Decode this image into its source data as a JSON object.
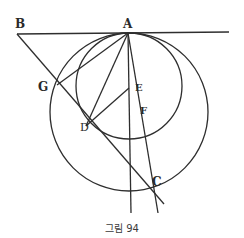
{
  "caption": "그림 94",
  "colors": {
    "ink": "#2e2e2e",
    "background": "#ffffff"
  },
  "points": {
    "A": {
      "label": "A",
      "x": 128,
      "y": 33
    },
    "B": {
      "label": "B",
      "x": 17,
      "y": 34
    },
    "G": {
      "label": "G",
      "x": 57,
      "y": 85
    },
    "D": {
      "label": "D",
      "x": 86,
      "y": 126
    },
    "E": {
      "label": "E",
      "x": 129,
      "y": 88
    },
    "F": {
      "label": "F",
      "x": 135,
      "y": 112
    },
    "C": {
      "label": "C",
      "x": 156,
      "y": 191
    }
  },
  "circles": {
    "large": {
      "cx": 129,
      "cy": 112,
      "r": 79
    },
    "small": {
      "cx": 129,
      "cy": 86,
      "r": 53
    }
  }
}
